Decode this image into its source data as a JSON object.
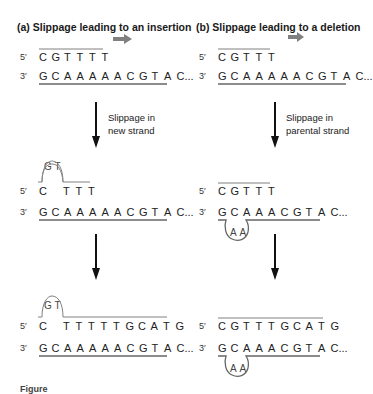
{
  "panels": [
    {
      "id": "a",
      "title": "(a) Slippage leading to an insertion",
      "stage1": {
        "top_label": "5′",
        "top_seq": [
          "C",
          "G",
          "T",
          "T",
          "T",
          "T"
        ],
        "bottom_label": "3′",
        "bottom_seq": [
          "G",
          "C",
          "A",
          "A",
          "A",
          "A",
          "A",
          "C",
          "G",
          "T",
          "A",
          "C..."
        ]
      },
      "step1_note": [
        "Slippage in",
        "new strand"
      ],
      "stage2": {
        "loop_bases": [
          "G",
          "T"
        ],
        "top_label": "5′",
        "top_first": "C",
        "top_seq": [
          "T",
          "T",
          "T"
        ],
        "bottom_label": "3′",
        "bottom_seq": [
          "G",
          "C",
          "A",
          "A",
          "A",
          "A",
          "A",
          "C",
          "G",
          "T",
          "A",
          "C..."
        ]
      },
      "stage3": {
        "loop_bases": [
          "G",
          "T"
        ],
        "top_label": "5′",
        "top_first": "C",
        "top_seq": [
          "T",
          "T",
          "T",
          "T",
          "T",
          "G",
          "C",
          "A",
          "T",
          "G"
        ],
        "bottom_label": "3′",
        "bottom_seq": [
          "G",
          "C",
          "A",
          "A",
          "A",
          "A",
          "A",
          "C",
          "G",
          "T",
          "A",
          "C..."
        ]
      }
    },
    {
      "id": "b",
      "title": "(b) Slippage leading to a deletion",
      "stage1": {
        "top_label": "5′",
        "top_seq": [
          "C",
          "G",
          "T",
          "T",
          "T"
        ],
        "bottom_label": "3′",
        "bottom_seq": [
          "G",
          "C",
          "A",
          "A",
          "A",
          "A",
          "A",
          "C",
          "G",
          "T",
          "A",
          "C..."
        ]
      },
      "step1_note": [
        "Slippage in",
        "parental strand"
      ],
      "stage2": {
        "top_label": "5′",
        "top_seq": [
          "C",
          "G",
          "T",
          "T",
          "T"
        ],
        "bottom_label": "3′",
        "bottom_seq": [
          "G",
          "C",
          "A",
          "A",
          "A",
          "C",
          "G",
          "T",
          "A",
          "C..."
        ],
        "loop_bases": [
          "A",
          "A"
        ]
      },
      "stage3": {
        "top_label": "5′",
        "top_seq": [
          "C",
          "G",
          "T",
          "T",
          "T",
          "G",
          "C",
          "A",
          "T",
          "G"
        ],
        "bottom_label": "3′",
        "bottom_seq": [
          "G",
          "C",
          "A",
          "A",
          "A",
          "C",
          "G",
          "T",
          "A",
          "C..."
        ],
        "loop_bases": [
          "A",
          "A"
        ]
      }
    }
  ],
  "colors": {
    "direction_arrow": "#808080",
    "strand_line": "#808080",
    "step_arrow": "#111111",
    "text": "#222222"
  },
  "caption": "Figure"
}
